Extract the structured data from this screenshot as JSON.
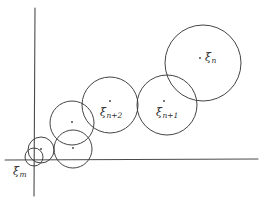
{
  "figure": {
    "background_color": "#ffffff",
    "stroke_color": "#3a3a3a",
    "axis_color": "#4a4a4a",
    "width": 268,
    "height": 203
  },
  "axes": {
    "x_axis": {
      "x1": 5,
      "y1": 160,
      "x2": 258,
      "y2": 159
    },
    "y_axis": {
      "x1": 35,
      "y1": 8,
      "x2": 34,
      "y2": 196
    }
  },
  "labels": {
    "xi_n": {
      "base": "ξ",
      "sub": "n"
    },
    "xi_n_1": {
      "base": "ξ",
      "sub": "n+1"
    },
    "xi_n_2": {
      "base": "ξ",
      "sub": "n+2"
    },
    "xi_m": {
      "base": "ξ",
      "sub": "m"
    }
  },
  "circles": [
    {
      "name": "circle-xi-n",
      "cx": 203,
      "cy": 63,
      "r": 38,
      "label": "ξ n",
      "labeled": true
    },
    {
      "name": "circle-xi-n-plus-1",
      "cx": 167,
      "cy": 105,
      "r": 30,
      "label": "ξ n+1",
      "labeled": true
    },
    {
      "name": "circle-xi-n-plus-2",
      "cx": 110,
      "cy": 105,
      "r": 28,
      "label": "ξ n+2",
      "labeled": true
    },
    {
      "name": "circle-unlabeled-a",
      "cx": 72,
      "cy": 123,
      "r": 22,
      "label": "",
      "labeled": false
    },
    {
      "name": "circle-unlabeled-b",
      "cx": 73,
      "cy": 149,
      "r": 19,
      "label": "",
      "labeled": false
    },
    {
      "name": "circle-unlabeled-c",
      "cx": 41,
      "cy": 150,
      "r": 13,
      "label": "",
      "labeled": false
    },
    {
      "name": "circle-xi-m",
      "cx": 34,
      "cy": 157,
      "r": 9,
      "label": "ξ m",
      "labeled": true
    }
  ],
  "center_dots": [
    {
      "name": "dot-xi-n",
      "cx": 200,
      "cy": 58,
      "r": 0.9
    },
    {
      "name": "dot-xi-n-plus-1",
      "cx": 164,
      "cy": 101,
      "r": 0.9
    },
    {
      "name": "dot-xi-n-plus-2",
      "cx": 110,
      "cy": 101,
      "r": 0.9
    },
    {
      "name": "dot-unlabeled-a",
      "cx": 72,
      "cy": 122,
      "r": 0.9
    },
    {
      "name": "dot-unlabeled-b",
      "cx": 73,
      "cy": 148,
      "r": 0.9
    },
    {
      "name": "dot-unlabeled-c",
      "cx": 41,
      "cy": 149,
      "r": 0.9
    }
  ]
}
